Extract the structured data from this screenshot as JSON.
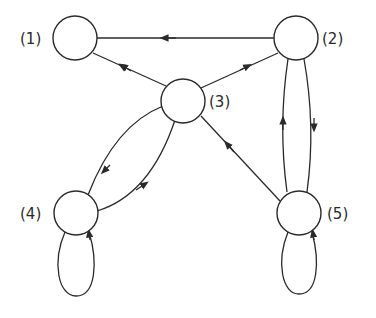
{
  "diagram": {
    "type": "directed-graph",
    "line_color": "#2a2a2a",
    "background": "#ffffff",
    "nodes": [
      {
        "id": "1",
        "label": "(1)",
        "cx": 75,
        "cy": 38
      },
      {
        "id": "2",
        "label": "(2)",
        "cx": 296,
        "cy": 38
      },
      {
        "id": "3",
        "label": "(3)",
        "cx": 183,
        "cy": 101
      },
      {
        "id": "4",
        "label": "(4)",
        "cx": 76,
        "cy": 213
      },
      {
        "id": "5",
        "label": "(5)",
        "cx": 299,
        "cy": 213
      }
    ],
    "edges": [
      {
        "from": "2",
        "to": "1"
      },
      {
        "from": "3",
        "to": "1"
      },
      {
        "from": "3",
        "to": "2"
      },
      {
        "from": "3",
        "to": "4"
      },
      {
        "from": "4",
        "to": "3"
      },
      {
        "from": "2",
        "to": "5"
      },
      {
        "from": "5",
        "to": "2"
      },
      {
        "from": "5",
        "to": "3"
      },
      {
        "from": "4",
        "to": "4"
      },
      {
        "from": "5",
        "to": "5"
      }
    ]
  }
}
